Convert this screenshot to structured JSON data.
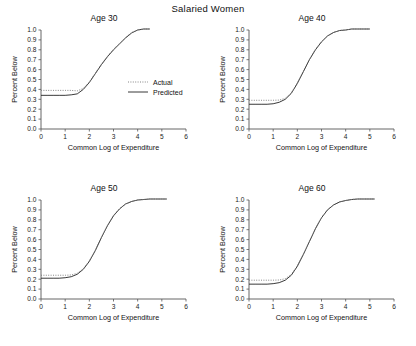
{
  "figure": {
    "title": "Salaried Women",
    "background": "#ffffff"
  },
  "legend": {
    "position": "inside-panel-age30-right",
    "entries": [
      {
        "label": "Actual",
        "style": "dotted",
        "color": "#777777"
      },
      {
        "label": "Predicted",
        "style": "solid",
        "color": "#222222"
      }
    ]
  },
  "chart_data": [
    {
      "type": "line",
      "title": "Age 30",
      "xlabel": "Common Log of Expenditure",
      "ylabel": "Percent Below",
      "xlim": [
        0,
        6
      ],
      "ylim": [
        0.0,
        1.0
      ],
      "xticks": [
        0,
        1,
        2,
        3,
        4,
        5,
        6
      ],
      "yticks": [
        0.0,
        0.1,
        0.2,
        0.3,
        0.4,
        0.5,
        0.6,
        0.7,
        0.8,
        0.9,
        1.0
      ],
      "ytick_labels": [
        "0.0",
        "0.1",
        "0.2",
        "0.3",
        "0.4",
        "0.5",
        "0.6",
        "0.7",
        "0.8",
        "0.9",
        "1.0"
      ],
      "xtick_labels": [
        "0",
        "1",
        "2",
        "3",
        "4",
        "5",
        "6"
      ],
      "grid": false,
      "x": [
        0.0,
        0.25,
        0.5,
        0.75,
        1.0,
        1.25,
        1.5,
        1.75,
        2.0,
        2.25,
        2.5,
        2.75,
        3.0,
        3.25,
        3.5,
        3.75,
        4.0,
        4.25,
        4.5
      ],
      "series": [
        {
          "name": "Predicted",
          "style": "solid",
          "values": [
            0.34,
            0.34,
            0.34,
            0.34,
            0.34,
            0.345,
            0.355,
            0.4,
            0.47,
            0.56,
            0.65,
            0.73,
            0.8,
            0.86,
            0.92,
            0.97,
            1.0,
            1.01,
            1.01
          ]
        },
        {
          "name": "Actual",
          "style": "dotted",
          "values": [
            0.39,
            0.39,
            0.39,
            0.39,
            0.39,
            0.39,
            0.385,
            0.41,
            0.475,
            0.565,
            0.655,
            0.735,
            0.805,
            0.865,
            0.925,
            0.975,
            1.0,
            1.01,
            1.01
          ]
        }
      ]
    },
    {
      "type": "line",
      "title": "Age 40",
      "xlabel": "Common Log of Expenditure",
      "ylabel": "Percent Below",
      "xlim": [
        0,
        6
      ],
      "ylim": [
        0.0,
        1.0
      ],
      "xticks": [
        0,
        1,
        2,
        3,
        4,
        5,
        6
      ],
      "yticks": [
        0.0,
        0.1,
        0.2,
        0.3,
        0.4,
        0.5,
        0.6,
        0.7,
        0.8,
        0.9,
        1.0
      ],
      "ytick_labels": [
        "0.0",
        "0.1",
        "0.2",
        "0.3",
        "0.4",
        "0.5",
        "0.6",
        "0.7",
        "0.8",
        "0.9",
        "1.0"
      ],
      "xtick_labels": [
        "0",
        "1",
        "2",
        "3",
        "4",
        "5",
        "6"
      ],
      "grid": false,
      "x": [
        0.0,
        0.25,
        0.5,
        0.75,
        1.0,
        1.25,
        1.5,
        1.75,
        2.0,
        2.25,
        2.5,
        2.75,
        3.0,
        3.25,
        3.5,
        3.75,
        4.0,
        4.25,
        4.5,
        4.75,
        5.0
      ],
      "series": [
        {
          "name": "Predicted",
          "style": "solid",
          "values": [
            0.25,
            0.25,
            0.25,
            0.25,
            0.255,
            0.27,
            0.3,
            0.36,
            0.46,
            0.58,
            0.7,
            0.8,
            0.88,
            0.94,
            0.975,
            0.995,
            1.0,
            1.01,
            1.01,
            1.01,
            1.01
          ]
        },
        {
          "name": "Actual",
          "style": "dotted",
          "values": [
            0.29,
            0.29,
            0.29,
            0.29,
            0.29,
            0.292,
            0.31,
            0.365,
            0.465,
            0.585,
            0.705,
            0.805,
            0.885,
            0.94,
            0.975,
            0.995,
            1.0,
            1.01,
            1.01,
            1.01,
            1.01
          ]
        }
      ]
    },
    {
      "type": "line",
      "title": "Age 50",
      "xlabel": "Common Log of Expenditure",
      "ylabel": "Percent Below",
      "xlim": [
        0,
        6
      ],
      "ylim": [
        0.0,
        1.0
      ],
      "xticks": [
        0,
        1,
        2,
        3,
        4,
        5,
        6
      ],
      "yticks": [
        0.0,
        0.1,
        0.2,
        0.3,
        0.4,
        0.5,
        0.6,
        0.7,
        0.8,
        0.9,
        1.0
      ],
      "ytick_labels": [
        "0.0",
        "0.1",
        "0.2",
        "0.3",
        "0.4",
        "0.5",
        "0.6",
        "0.7",
        "0.8",
        "0.9",
        "1.0"
      ],
      "xtick_labels": [
        "0",
        "1",
        "2",
        "3",
        "4",
        "5",
        "6"
      ],
      "grid": false,
      "x": [
        0.0,
        0.25,
        0.5,
        0.75,
        1.0,
        1.25,
        1.5,
        1.75,
        2.0,
        2.25,
        2.5,
        2.75,
        3.0,
        3.25,
        3.5,
        3.75,
        4.0,
        4.25,
        4.5,
        4.75,
        5.0,
        5.2
      ],
      "series": [
        {
          "name": "Predicted",
          "style": "solid",
          "values": [
            0.21,
            0.21,
            0.21,
            0.21,
            0.215,
            0.225,
            0.25,
            0.3,
            0.38,
            0.49,
            0.62,
            0.74,
            0.84,
            0.91,
            0.96,
            0.985,
            1.0,
            1.005,
            1.01,
            1.01,
            1.01,
            1.01
          ]
        },
        {
          "name": "Actual",
          "style": "dotted",
          "values": [
            0.24,
            0.24,
            0.24,
            0.24,
            0.24,
            0.243,
            0.26,
            0.305,
            0.385,
            0.495,
            0.625,
            0.745,
            0.845,
            0.912,
            0.96,
            0.985,
            1.0,
            1.005,
            1.01,
            1.01,
            1.01,
            1.01
          ]
        }
      ]
    },
    {
      "type": "line",
      "title": "Age 60",
      "xlabel": "Common Log of Expenditure",
      "ylabel": "Percent Below",
      "xlim": [
        0,
        6
      ],
      "ylim": [
        0.0,
        1.0
      ],
      "xticks": [
        0,
        1,
        2,
        3,
        4,
        5,
        6
      ],
      "yticks": [
        0.0,
        0.1,
        0.2,
        0.3,
        0.4,
        0.5,
        0.6,
        0.7,
        0.8,
        0.9,
        1.0
      ],
      "ytick_labels": [
        "0.0",
        "0.1",
        "0.2",
        "0.3",
        "0.4",
        "0.5",
        "0.6",
        "0.7",
        "0.8",
        "0.9",
        "1.0"
      ],
      "xtick_labels": [
        "0",
        "1",
        "2",
        "3",
        "4",
        "5",
        "6"
      ],
      "grid": false,
      "x": [
        0.0,
        0.25,
        0.5,
        0.75,
        1.0,
        1.25,
        1.5,
        1.75,
        2.0,
        2.25,
        2.5,
        2.75,
        3.0,
        3.25,
        3.5,
        3.75,
        4.0,
        4.25,
        4.5,
        4.75,
        5.0,
        5.2
      ],
      "series": [
        {
          "name": "Predicted",
          "style": "solid",
          "values": [
            0.15,
            0.15,
            0.15,
            0.15,
            0.155,
            0.165,
            0.19,
            0.24,
            0.33,
            0.45,
            0.58,
            0.71,
            0.82,
            0.9,
            0.95,
            0.98,
            0.995,
            1.005,
            1.01,
            1.01,
            1.01,
            1.01
          ]
        },
        {
          "name": "Actual",
          "style": "dotted",
          "values": [
            0.19,
            0.19,
            0.19,
            0.19,
            0.19,
            0.192,
            0.205,
            0.248,
            0.335,
            0.455,
            0.585,
            0.715,
            0.823,
            0.902,
            0.952,
            0.982,
            0.995,
            1.005,
            1.01,
            1.01,
            1.01,
            1.01
          ]
        }
      ]
    }
  ]
}
